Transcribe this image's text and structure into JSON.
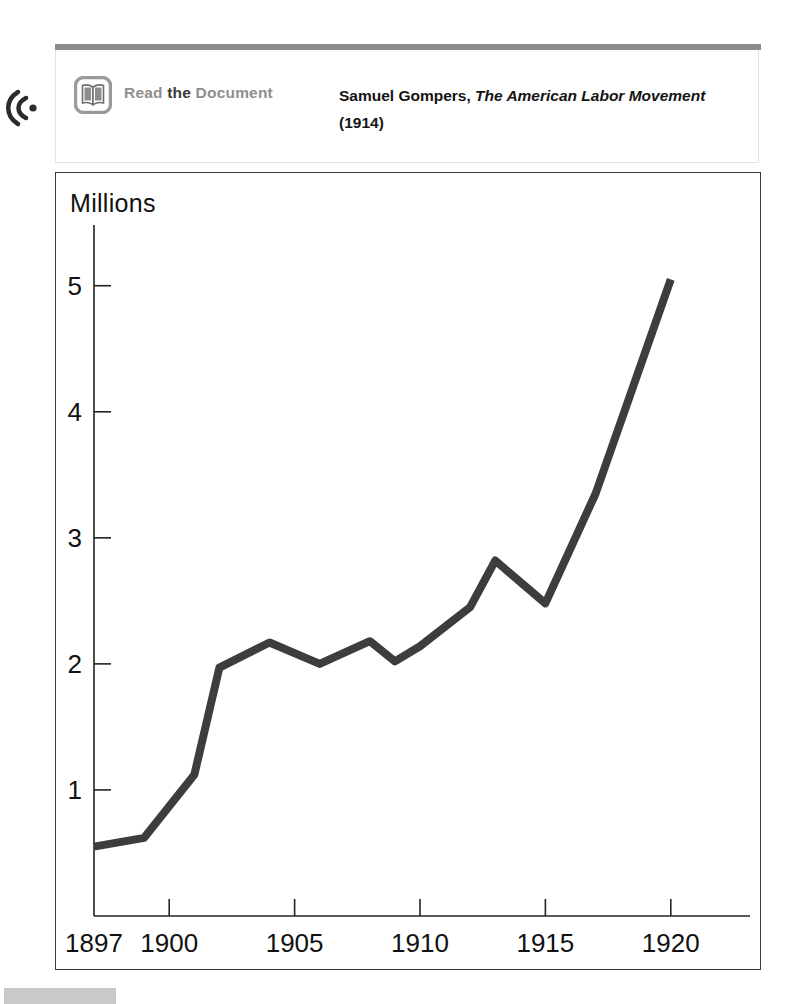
{
  "media_note": {
    "audio_icon": "audio-speaker-icon",
    "book_icon": "open-book-icon",
    "read_word": "Read",
    "the_word": " the ",
    "document_word": "Document",
    "citation_author": "Samuel Gompers, ",
    "citation_title": "The American Labor Movement",
    "citation_year": " (1914)",
    "rule_color": "#8c8c8c"
  },
  "chart_data": {
    "type": "line",
    "title": "",
    "ylabel": "Millions",
    "xlabel": "",
    "grid": false,
    "legend": false,
    "line_color": "#3d3d3d",
    "axis_color": "#222222",
    "xlim": [
      1897,
      1923
    ],
    "ylim": [
      0,
      5.45
    ],
    "xticks": [
      1897,
      1900,
      1905,
      1910,
      1915,
      1920
    ],
    "xtick_labels": [
      "1897",
      "1900",
      "1905",
      "1910",
      "1915",
      "1920"
    ],
    "yticks": [
      1,
      2,
      3,
      4,
      5
    ],
    "ytick_labels": [
      "1",
      "2",
      "3",
      "4",
      "5"
    ],
    "series": [
      {
        "name": "Union membership",
        "x": [
          1897,
          1899,
          1900,
          1901,
          1902,
          1904,
          1906,
          1908,
          1909,
          1910,
          1912,
          1913,
          1915,
          1917,
          1920
        ],
        "values": [
          0.55,
          0.62,
          0.87,
          1.12,
          1.97,
          2.17,
          2.0,
          2.18,
          2.02,
          2.14,
          2.45,
          2.82,
          2.48,
          3.35,
          5.05
        ]
      }
    ]
  }
}
